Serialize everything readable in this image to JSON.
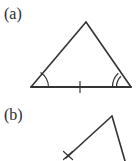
{
  "figure": {
    "width": 136,
    "height": 161,
    "background_color": "#ffffff",
    "stroke_color": "#333333",
    "text_color": "#2b2b2b"
  },
  "panels": [
    {
      "id": "a",
      "label": "(a)",
      "description": "triangle with angle arcs and a base tick mark"
    },
    {
      "id": "b",
      "label": "(b)",
      "description": "partial triangle cropped at the bottom with an x mark on the left side"
    }
  ],
  "panel_a": {
    "label": "(a)",
    "shape": "triangle",
    "vertices": {
      "apex": [
        86,
        22
      ],
      "bottom_left": [
        31,
        87
      ],
      "bottom_right": [
        131,
        87
      ]
    },
    "angle_marks": [
      {
        "at": "bottom-left",
        "arcs": 1
      },
      {
        "at": "bottom-right",
        "arcs": 2
      }
    ],
    "tick_marks": [
      {
        "on": "base",
        "position": [
          80,
          87
        ],
        "count": 1
      }
    ]
  },
  "panel_b": {
    "label": "(b)",
    "shape": "partial-triangle",
    "vertices": {
      "apex": [
        112,
        116
      ],
      "left_end": [
        67,
        157
      ],
      "right_end": [
        125,
        161
      ]
    },
    "marks": [
      {
        "type": "x-mark",
        "position": [
          68,
          155
        ]
      }
    ]
  }
}
